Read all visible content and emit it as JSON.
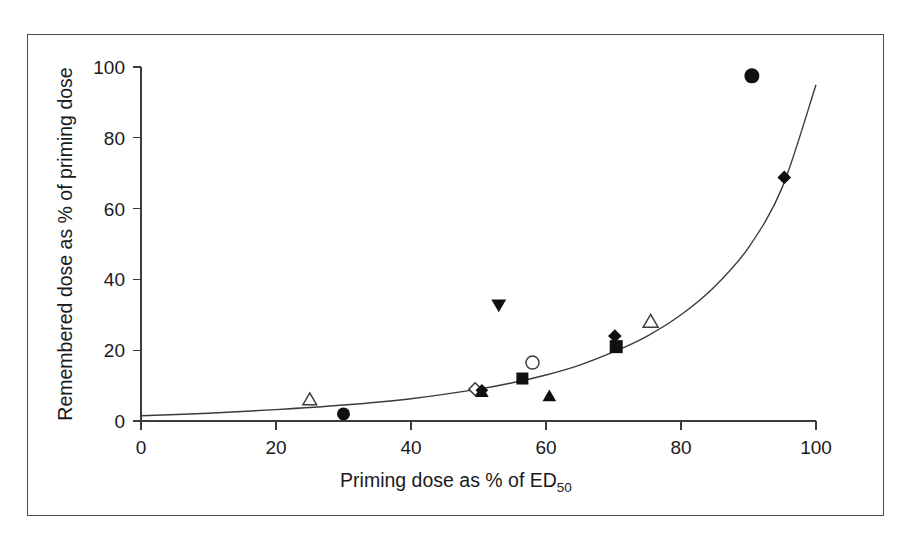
{
  "figure": {
    "background_color": "#ffffff",
    "frame_color": "#4a4a4a",
    "axis_color": "#3b3b3b",
    "marker_fill_color": "#101010"
  },
  "chart_data": {
    "type": "scatter",
    "title": "",
    "subtitle": "",
    "xlabel": "Priming dose as % of ED",
    "xlabel_subscript": "50",
    "xlabel_full": "Priming dose as % of ED50",
    "ylabel": "Remembered dose as % of priming dose",
    "xlim": [
      0,
      100
    ],
    "ylim": [
      0,
      100
    ],
    "xticks": [
      0,
      20,
      40,
      60,
      80,
      100
    ],
    "yticks": [
      0,
      20,
      40,
      60,
      80,
      100
    ],
    "xtick_labels": [
      "0",
      "20",
      "40",
      "60",
      "80",
      "100"
    ],
    "ytick_labels": [
      "0",
      "20",
      "40",
      "60",
      "80",
      "100"
    ],
    "grid": false,
    "legend": false,
    "legend_position": "none",
    "points": [
      {
        "x": 25.0,
        "y": 6.0,
        "marker": "triangle-up",
        "filled": false,
        "size": 11
      },
      {
        "x": 30.0,
        "y": 2.0,
        "marker": "circle",
        "filled": true,
        "size": 13
      },
      {
        "x": 49.5,
        "y": 9.0,
        "marker": "diamond",
        "filled": false,
        "size": 12
      },
      {
        "x": 50.5,
        "y": 8.7,
        "marker": "diamond",
        "filled": true,
        "size": 12
      },
      {
        "x": 50.5,
        "y": 8.2,
        "marker": "triangle-up",
        "filled": true,
        "size": 11
      },
      {
        "x": 53.0,
        "y": 32.8,
        "marker": "triangle-down",
        "filled": true,
        "size": 12
      },
      {
        "x": 56.5,
        "y": 12.0,
        "marker": "square",
        "filled": true,
        "size": 12
      },
      {
        "x": 58.0,
        "y": 16.5,
        "marker": "circle",
        "filled": false,
        "size": 13
      },
      {
        "x": 60.5,
        "y": 7.0,
        "marker": "triangle-up",
        "filled": true,
        "size": 11
      },
      {
        "x": 70.2,
        "y": 24.0,
        "marker": "diamond",
        "filled": true,
        "size": 13
      },
      {
        "x": 70.4,
        "y": 21.0,
        "marker": "square",
        "filled": true,
        "size": 13
      },
      {
        "x": 75.5,
        "y": 28.0,
        "marker": "triangle-up",
        "filled": false,
        "size": 12
      },
      {
        "x": 90.5,
        "y": 97.5,
        "marker": "circle",
        "filled": true,
        "size": 15
      },
      {
        "x": 95.3,
        "y": 68.8,
        "marker": "diamond",
        "filled": true,
        "size": 13
      }
    ],
    "fit_curve": {
      "description": "exponential fit line",
      "x": [
        0,
        10,
        20,
        30,
        40,
        50,
        55,
        60,
        65,
        70,
        75,
        80,
        85,
        90,
        95,
        100
      ],
      "y": [
        1.5,
        2.2,
        3.2,
        4.5,
        6.3,
        9.0,
        10.8,
        13.0,
        15.8,
        19.5,
        24.0,
        30.0,
        38.0,
        49.0,
        66.0,
        95.0
      ]
    }
  }
}
